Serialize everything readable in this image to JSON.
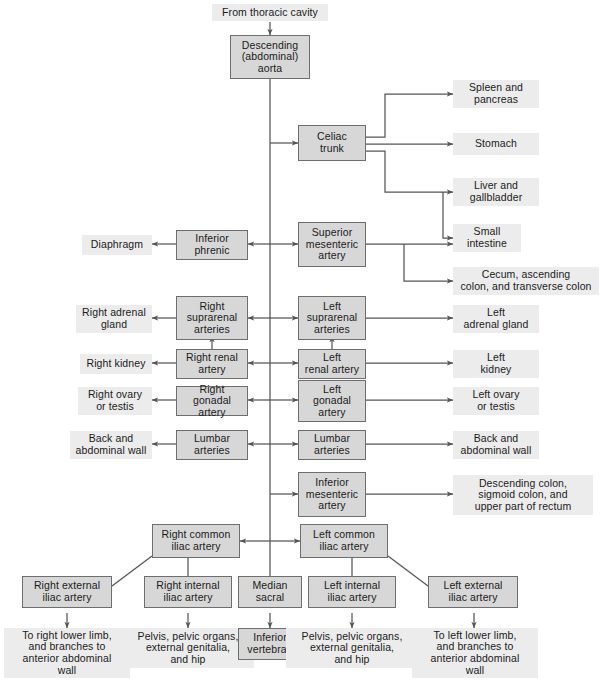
{
  "diagram": {
    "colors": {
      "boxed_fill": "#d7d7d7",
      "boxed_border": "#6e6e6e",
      "plain_fill": "#ececec",
      "line": "#555555",
      "text": "#1a1a1a"
    }
  },
  "nodes": {
    "from_thoracic_cavity": "From thoracic cavity",
    "descending_aorta": "Descending\n(abdominal)\naorta",
    "celiac_trunk": "Celiac\ntrunk",
    "spleen_pancreas": "Spleen and\npancreas",
    "stomach": "Stomach",
    "liver_gallbladder": "Liver and\ngallbladder",
    "small_intestine": "Small\nintestine",
    "cecum_colon": "Cecum, ascending\ncolon, and transverse colon",
    "superior_mesenteric_artery": "Superior\nmesenteric\nartery",
    "inferior_phrenic": "Inferior\nphrenic",
    "diaphragm": "Diaphragm",
    "right_suprarenal_arteries": "Right\nsuprarenal\narteries",
    "left_suprarenal_arteries": "Left\nsuprarenal\narteries",
    "right_adrenal_gland": "Right adrenal\ngland",
    "left_adrenal_gland": "Left\nadrenal gland",
    "right_renal_artery": "Right renal\nartery",
    "left_renal_artery": "Left\nrenal artery",
    "right_kidney": "Right kidney",
    "left_kidney": "Left\nkidney",
    "right_gonadal_artery": "Right gonadal\nartery",
    "left_gonadal_artery": "Left\ngonadal\nartery",
    "right_ovary_testis": "Right ovary\nor testis",
    "left_ovary_testis": "Left ovary\nor testis",
    "right_lumbar_arteries": "Lumbar\narteries",
    "left_lumbar_arteries": "Lumbar\narteries",
    "right_back_wall": "Back and\nabdominal wall",
    "left_back_wall": "Back and\nabdominal wall",
    "inferior_mesenteric_artery": "Inferior\nmesenteric\nartery",
    "descending_sigmoid_rectum": "Descending colon,\nsigmoid colon, and\nupper part of rectum",
    "right_common_iliac": "Right common\niliac artery",
    "left_common_iliac": "Left common\niliac artery",
    "right_external_iliac": "Right external\niliac artery",
    "right_internal_iliac": "Right internal\niliac artery",
    "median_sacral": "Median\nsacral",
    "left_internal_iliac": "Left internal\niliac artery",
    "left_external_iliac": "Left external\niliac artery",
    "right_lower_limb": "To right lower limb,\nand branches to\nanterior abdominal\nwall",
    "right_pelvis": "Pelvis, pelvic organs,\nexternal genitalia,\nand hip",
    "inferior_vertebrae": "Inferior\nvertebrae",
    "left_pelvis": "Pelvis, pelvic organs,\nexternal genitalia,\nand hip",
    "left_lower_limb": "To left lower limb,\nand branches to\nanterior abdominal\nwall"
  }
}
